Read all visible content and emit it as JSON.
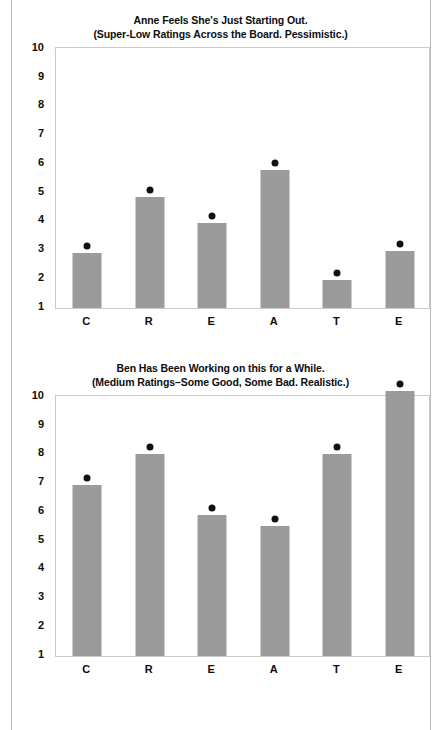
{
  "page": {
    "rules": [
      "left-rule",
      "right-rule"
    ]
  },
  "chart_data": [
    {
      "type": "bar",
      "title": "Anne Feels She's Just Starting Out.",
      "subtitle": "(Super-Low Ratings Across the Board. Pessimistic.)",
      "categories": [
        "C",
        "R",
        "E",
        "A",
        "T",
        "E"
      ],
      "values": [
        2.8,
        4.75,
        3.85,
        5.7,
        1.85,
        2.85
      ],
      "xlabel": "",
      "ylabel": "",
      "ylim": [
        1,
        10
      ],
      "yticks": [
        1,
        2,
        3,
        4,
        5,
        6,
        7,
        8,
        9,
        10
      ],
      "grid": false,
      "legend": "none",
      "bar_color": "#9b9b9b",
      "marker_color": "#111111",
      "marker": "dot-at-bar-top"
    },
    {
      "type": "bar",
      "title": "Ben Has Been Working on this for a While.",
      "subtitle": "(Medium Ratings–Some Good, Some Bad. Realistic.)",
      "categories": [
        "C",
        "R",
        "E",
        "A",
        "T",
        "E"
      ],
      "values": [
        6.85,
        7.9,
        5.8,
        5.4,
        7.9,
        10.1
      ],
      "xlabel": "",
      "ylabel": "",
      "ylim": [
        1,
        10
      ],
      "yticks": [
        1,
        2,
        3,
        4,
        5,
        6,
        7,
        8,
        9,
        10
      ],
      "grid": false,
      "legend": "none",
      "bar_color": "#9b9b9b",
      "marker_color": "#111111",
      "marker": "dot-at-bar-top"
    }
  ]
}
